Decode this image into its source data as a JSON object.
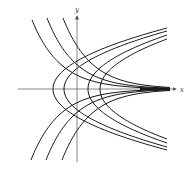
{
  "diagram": {
    "title": "",
    "axes": {
      "x_label": "x",
      "y_label": "y",
      "origin_px": [
        77,
        89
      ],
      "x_range_px": [
        18,
        176
      ],
      "y_range_px": [
        16,
        162
      ]
    },
    "colors": {
      "curve": "#1a1a1a",
      "axis": "#555555",
      "background": "#ffffff"
    },
    "families": [
      {
        "name": "parabolas-opening-right",
        "description": "x = y^2 + C",
        "vertices_x_px": [
          53,
          64,
          88,
          100
        ],
        "arm_end_x_px": 167,
        "arm_half_heights_px": [
          61,
          58,
          54,
          50
        ]
      },
      {
        "name": "exponential-curves",
        "description": "y = C e^{-x}",
        "upper_start_px": [
          [
            32,
            20
          ],
          [
            47,
            18
          ],
          [
            63,
            18
          ]
        ],
        "lower_start_px": [
          [
            31,
            160
          ],
          [
            46,
            160
          ],
          [
            62,
            160
          ]
        ],
        "converge_x_px": 170
      }
    ]
  }
}
